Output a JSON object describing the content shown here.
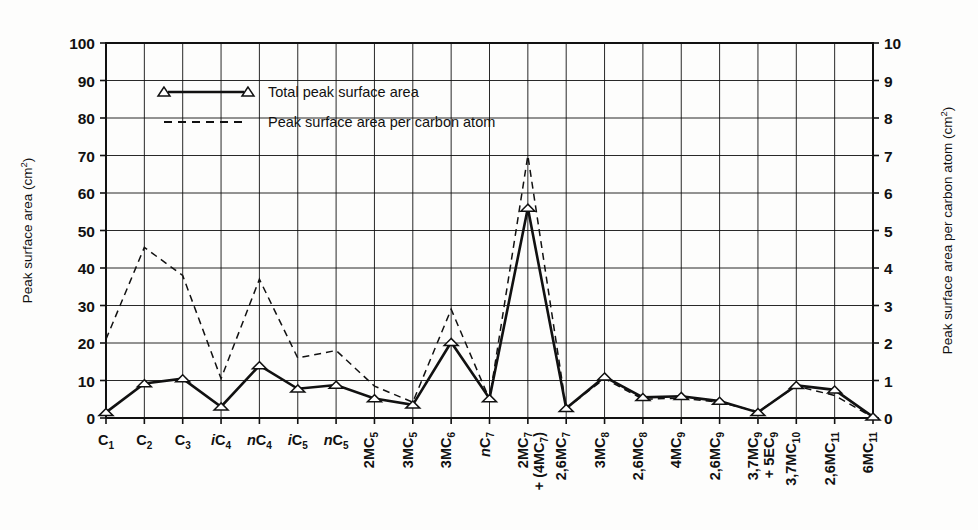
{
  "chart_data": {
    "type": "line",
    "title": "",
    "xlabel": "",
    "ylabel": "Peak surface area (cm2)",
    "ylabel_right": "Peak surface area per carbon atom (cm2)",
    "ylim": [
      0,
      100
    ],
    "ylim_right": [
      0,
      10
    ],
    "yticks": [
      "0",
      "10",
      "20",
      "30",
      "40",
      "50",
      "60",
      "70",
      "80",
      "90",
      "100"
    ],
    "yticks_right": [
      "0",
      "1",
      "2",
      "3",
      "4",
      "5",
      "6",
      "7",
      "8",
      "9",
      "10"
    ],
    "grid": true,
    "legend_position": "upper-left-inside",
    "categories": [
      "C1",
      "C2",
      "C3",
      "iC4",
      "nC4",
      "iC5",
      "nC5",
      "2MC5",
      "3MC5",
      "3MC6",
      "nC7",
      "2MC7 + (4MC7)",
      "2,6MC7",
      "3MC8",
      "2,6MC8",
      "4MC9",
      "2,6MC9",
      "3,7MC9 + 5EC9",
      "3,7MC10",
      "2,6MC11",
      "6MC11"
    ],
    "series": [
      {
        "name": "Total peak surface area",
        "axis": "left",
        "style": "solid-with-triangle-markers",
        "values": [
          1.5,
          9.2,
          10.5,
          3.0,
          14.0,
          7.8,
          8.8,
          5.2,
          3.5,
          20.2,
          5.2,
          56.0,
          2.6,
          11.0,
          5.5,
          5.8,
          4.5,
          1.5,
          8.7,
          7.5,
          0.3
        ]
      },
      {
        "name": "Peak surface area per carbon atom",
        "axis": "right",
        "style": "dashed",
        "values": [
          2.1,
          4.55,
          3.8,
          1.05,
          3.7,
          1.6,
          1.8,
          0.85,
          0.42,
          2.9,
          0.5,
          7.0,
          0.26,
          1.05,
          0.5,
          0.53,
          0.42,
          0.17,
          0.85,
          0.6,
          0.02
        ]
      }
    ],
    "legend": [
      {
        "label": "Total peak surface area",
        "style": "solid-triangles"
      },
      {
        "label": "Peak surface area per carbon atom",
        "style": "dashed"
      }
    ]
  },
  "axes": {
    "left_title_main": "Peak surface area (cm",
    "left_title_sup": "2",
    "left_title_end": ")",
    "right_title_main": "Peak surface area per carbon atom (cm",
    "right_title_sup": "2",
    "right_title_end": ")"
  },
  "category_labels": [
    {
      "pre": "",
      "base": "C",
      "sub": "1",
      "italic_pre": false,
      "rotated": false,
      "line2": null
    },
    {
      "pre": "",
      "base": "C",
      "sub": "2",
      "italic_pre": false,
      "rotated": false,
      "line2": null
    },
    {
      "pre": "",
      "base": "C",
      "sub": "3",
      "italic_pre": false,
      "rotated": false,
      "line2": null
    },
    {
      "pre": "i",
      "base": "C",
      "sub": "4",
      "italic_pre": true,
      "rotated": false,
      "line2": null
    },
    {
      "pre": "n",
      "base": "C",
      "sub": "4",
      "italic_pre": true,
      "rotated": false,
      "line2": null
    },
    {
      "pre": "i",
      "base": "C",
      "sub": "5",
      "italic_pre": true,
      "rotated": false,
      "line2": null
    },
    {
      "pre": "n",
      "base": "C",
      "sub": "5",
      "italic_pre": true,
      "rotated": false,
      "line2": null
    },
    {
      "pre": "2MC",
      "base": "",
      "sub": "5",
      "italic_pre": false,
      "rotated": true,
      "line2": null
    },
    {
      "pre": "3MC",
      "base": "",
      "sub": "5",
      "italic_pre": false,
      "rotated": true,
      "line2": null
    },
    {
      "pre": "3MC",
      "base": "",
      "sub": "6",
      "italic_pre": false,
      "rotated": true,
      "line2": null
    },
    {
      "pre": "n",
      "base": "C",
      "sub": "7",
      "italic_pre": true,
      "rotated": true,
      "line2": null
    },
    {
      "pre": "2MC",
      "base": "",
      "sub": "7",
      "italic_pre": false,
      "rotated": true,
      "line2": "+ (4MC7)"
    },
    {
      "pre": "2,6MC",
      "base": "",
      "sub": "7",
      "italic_pre": false,
      "rotated": true,
      "line2": null
    },
    {
      "pre": "3MC",
      "base": "",
      "sub": "8",
      "italic_pre": false,
      "rotated": true,
      "line2": null
    },
    {
      "pre": "2,6MC",
      "base": "",
      "sub": "8",
      "italic_pre": false,
      "rotated": true,
      "line2": null
    },
    {
      "pre": "4MC",
      "base": "",
      "sub": "9",
      "italic_pre": false,
      "rotated": true,
      "line2": null
    },
    {
      "pre": "2,6MC",
      "base": "",
      "sub": "9",
      "italic_pre": false,
      "rotated": true,
      "line2": null
    },
    {
      "pre": "3,7MC",
      "base": "",
      "sub": "9",
      "italic_pre": false,
      "rotated": true,
      "line2": "+ 5EC9"
    },
    {
      "pre": "3,7MC",
      "base": "",
      "sub": "10",
      "italic_pre": false,
      "rotated": true,
      "line2": null
    },
    {
      "pre": "2,6MC",
      "base": "",
      "sub": "11",
      "italic_pre": false,
      "rotated": true,
      "line2": null
    },
    {
      "pre": "6MC",
      "base": "",
      "sub": "11",
      "italic_pre": false,
      "rotated": true,
      "line2": null
    }
  ],
  "colors": {
    "ink": "#111111",
    "grid": "#222222",
    "background": "#fdfdfc"
  }
}
